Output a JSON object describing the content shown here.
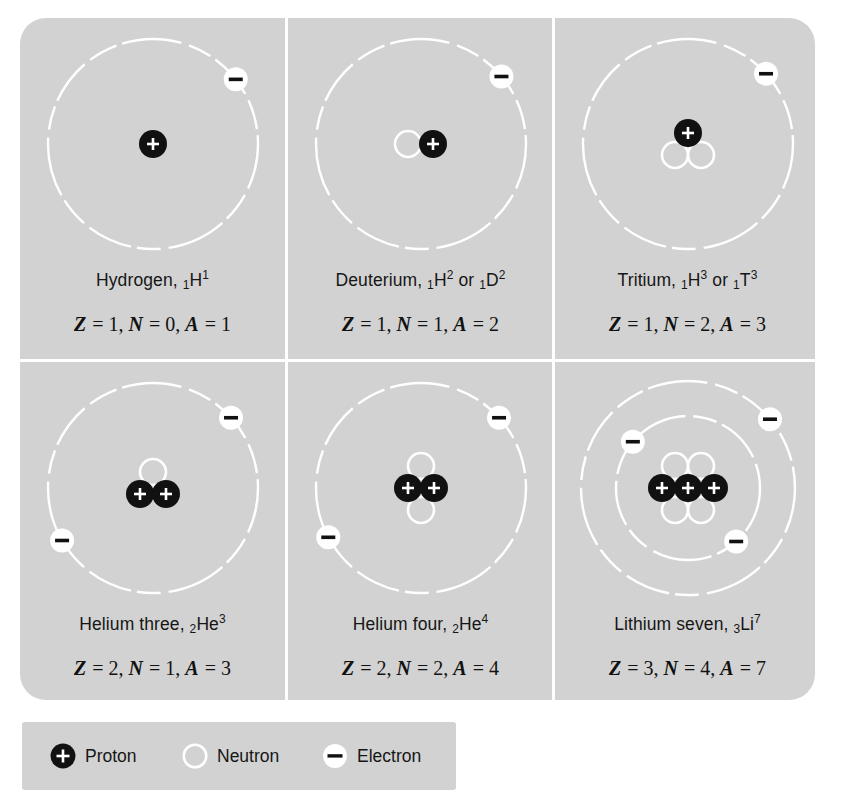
{
  "figure": {
    "background_color": "#ffffff",
    "panel_color": "#d2d2d2",
    "divider_color": "#ffffff",
    "proton_color": "#111111",
    "neutron_color": "#ffffff",
    "electron_color": "#ffffff",
    "orbit_color": "#ffffff",
    "text_color": "#161616"
  },
  "chart_data": {
    "type": "diagram",
    "columns": 3,
    "rows": 2,
    "atoms": [
      {
        "name": "Hydrogen",
        "symbol_text": "Hydrogen,",
        "notation": [
          {
            "sub": "1",
            "element": "H",
            "sup": "1"
          }
        ],
        "Z": 1,
        "N": 0,
        "A": 1,
        "formula": "Z = 1, N = 0, A = 1",
        "protons": 1,
        "neutrons": 0,
        "electrons": 1,
        "shells": 1
      },
      {
        "name": "Deuterium",
        "symbol_text": "Deuterium,",
        "notation": [
          {
            "sub": "1",
            "element": "H",
            "sup": "2"
          },
          {
            "sub": "1",
            "element": "D",
            "sup": "2"
          }
        ],
        "joiner": "or",
        "Z": 1,
        "N": 1,
        "A": 2,
        "formula": "Z = 1, N = 1, A = 2",
        "protons": 1,
        "neutrons": 1,
        "electrons": 1,
        "shells": 1
      },
      {
        "name": "Tritium",
        "symbol_text": "Tritium,",
        "notation": [
          {
            "sub": "1",
            "element": "H",
            "sup": "3"
          },
          {
            "sub": "1",
            "element": "T",
            "sup": "3"
          }
        ],
        "joiner": "or",
        "Z": 1,
        "N": 2,
        "A": 3,
        "formula": "Z = 1, N = 2, A = 3",
        "protons": 1,
        "neutrons": 2,
        "electrons": 1,
        "shells": 1
      },
      {
        "name": "Helium three",
        "symbol_text": "Helium three,",
        "notation": [
          {
            "sub": "2",
            "element": "He",
            "sup": "3"
          }
        ],
        "Z": 2,
        "N": 1,
        "A": 3,
        "formula": "Z = 2, N = 1, A = 3",
        "protons": 2,
        "neutrons": 1,
        "electrons": 2,
        "shells": 1
      },
      {
        "name": "Helium four",
        "symbol_text": "Helium four,",
        "notation": [
          {
            "sub": "2",
            "element": "He",
            "sup": "4"
          }
        ],
        "Z": 2,
        "N": 2,
        "A": 4,
        "formula": "Z = 2, N = 2, A = 4",
        "protons": 2,
        "neutrons": 2,
        "electrons": 2,
        "shells": 1
      },
      {
        "name": "Lithium seven",
        "symbol_text": "Lithium seven,",
        "notation": [
          {
            "sub": "3",
            "element": "Li",
            "sup": "7"
          }
        ],
        "Z": 3,
        "N": 4,
        "A": 7,
        "formula": "Z = 3, N = 4, A = 7",
        "protons": 3,
        "neutrons": 4,
        "electrons": 3,
        "shells": 2
      }
    ]
  },
  "legend": {
    "items": [
      {
        "glyph": "proton-icon",
        "label": "Proton"
      },
      {
        "glyph": "neutron-icon",
        "label": "Neutron"
      },
      {
        "glyph": "electron-icon",
        "label": "Electron"
      }
    ]
  }
}
